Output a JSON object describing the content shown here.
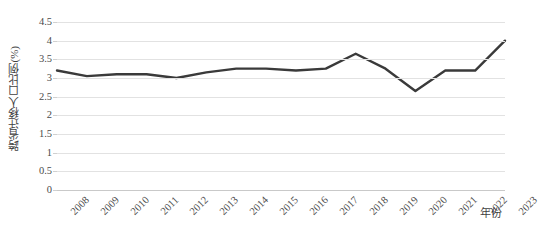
{
  "chart_data": {
    "type": "line",
    "title": "",
    "xlabel": "年份",
    "ylabel": "跨省迁移人口比例(%)",
    "categories": [
      "2008",
      "2009",
      "2010",
      "2011",
      "2012",
      "2013",
      "2014",
      "2015",
      "2016",
      "2017",
      "2018",
      "2019",
      "2020",
      "2021",
      "2022",
      "2023"
    ],
    "x": [
      2008,
      2009,
      2010,
      2011,
      2012,
      2013,
      2014,
      2015,
      2016,
      2017,
      2018,
      2019,
      2020,
      2021,
      2022,
      2023
    ],
    "values": [
      3.2,
      3.05,
      3.1,
      3.1,
      3.0,
      3.15,
      3.25,
      3.25,
      3.2,
      3.25,
      3.65,
      3.25,
      2.65,
      3.2,
      3.2,
      4.0
    ],
    "series": [
      {
        "name": "跨省迁移人口比例(%)",
        "values": [
          3.2,
          3.05,
          3.1,
          3.1,
          3.0,
          3.15,
          3.25,
          3.25,
          3.2,
          3.25,
          3.65,
          3.25,
          2.65,
          3.2,
          3.2,
          4.0
        ],
        "color": "#3a3a3a"
      }
    ],
    "ylim": [
      0,
      4.5
    ],
    "yticks": [
      0,
      0.5,
      1,
      1.5,
      2,
      2.5,
      3,
      3.5,
      4,
      4.5
    ],
    "ytick_labels": [
      "0",
      "0.5",
      "1",
      "1.5",
      "2",
      "2.5",
      "3",
      "3.5",
      "4",
      "4.5"
    ],
    "xlim": [
      2008,
      2023
    ],
    "grid": true,
    "grid_color": "#e2e2e2",
    "legend": false,
    "legend_position": "none",
    "line_color": "#3a3a3a",
    "line_width": 2.4,
    "markers": false,
    "background": "#ffffff"
  }
}
